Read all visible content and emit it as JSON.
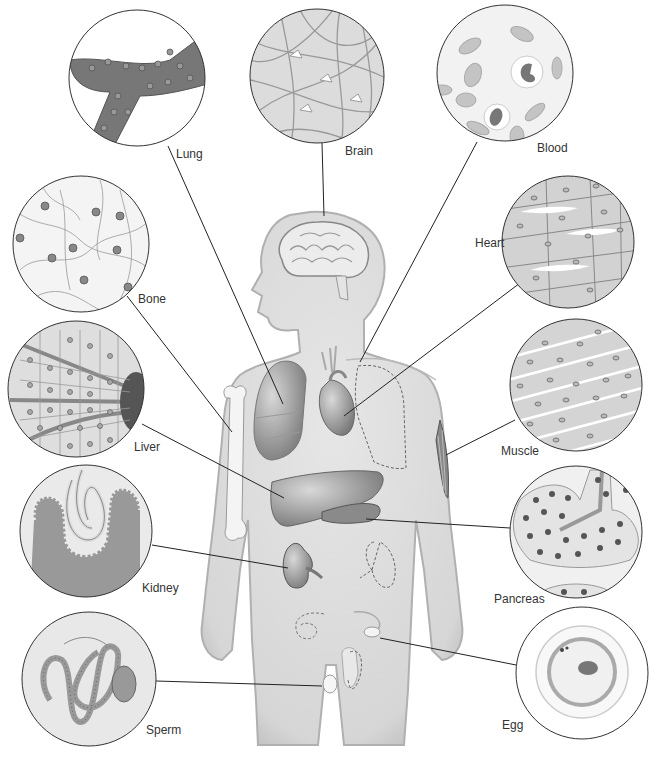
{
  "labels": {
    "lung": "Lung",
    "brain": "Brain",
    "blood": "Blood",
    "bone": "Bone",
    "heart": "Heart",
    "liver": "Liver",
    "muscle": "Muscle",
    "kidney": "Kidney",
    "pancreas": "Pancreas",
    "sperm": "Sperm",
    "egg": "Egg"
  },
  "colors": {
    "body_fill": "#dcdcdc",
    "body_stroke": "#a8a8a8",
    "organ_dark": "#8a8a8a",
    "organ_light": "#f0f0f0",
    "circle_stroke": "#333333",
    "leader_line": "#222222",
    "tissue_bg": "#cfcfcf"
  }
}
